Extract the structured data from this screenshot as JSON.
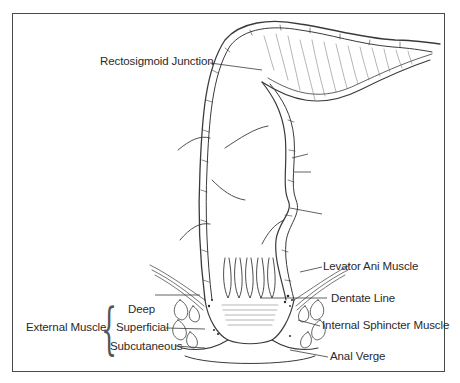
{
  "diagram": {
    "labels": {
      "rectosigmoid": "Rectosigmoid Junction",
      "levator": "Levator Ani Muscle",
      "dentate": "Dentate Line",
      "internal_sphincter": "Internal Sphincter Muscle",
      "anal_verge": "Anal Verge",
      "external_group": "External Muscle",
      "deep": "Deep",
      "superficial": "Superficial",
      "subcutaneous": "Subcutaneous"
    },
    "unlabeled_leaders": 3,
    "colors": {
      "line": "#3a3a3a",
      "text": "#2a2a2a",
      "border": "#4a4a4a",
      "background": "#ffffff"
    }
  }
}
